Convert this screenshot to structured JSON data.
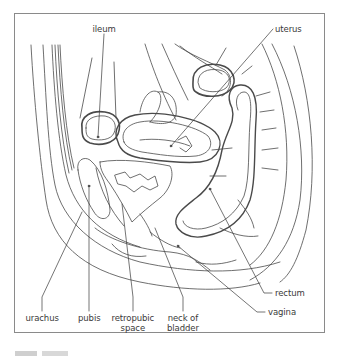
{
  "figure": {
    "labels": [
      {
        "id": "ileum",
        "text": "ileum",
        "anchor": [
          104,
          46
        ],
        "target": [
          98,
          137
        ]
      },
      {
        "id": "uterus",
        "text": "uterus",
        "anchor": [
          275,
          29
        ],
        "target": [
          171,
          146
        ]
      },
      {
        "id": "urachus",
        "text": "urachus",
        "anchor": [
          42,
          313
        ],
        "target": [
          82,
          212
        ]
      },
      {
        "id": "pubis",
        "text": "pubis",
        "anchor": [
          89,
          313
        ],
        "target": [
          89,
          186
        ]
      },
      {
        "id": "retropubic-space",
        "text": "retropubic\nspace",
        "anchor": [
          133,
          313
        ],
        "target": [
          122,
          204
        ]
      },
      {
        "id": "neck-of-bladder",
        "text": "neck of\nbladder",
        "anchor": [
          183,
          313
        ],
        "target": [
          155,
          228
        ]
      },
      {
        "id": "rectum",
        "text": "rectum",
        "anchor": [
          272,
          293
        ],
        "target": [
          210,
          189
        ]
      },
      {
        "id": "vagina",
        "text": "vagina",
        "anchor": [
          265,
          312
        ],
        "target": [
          178,
          246
        ]
      }
    ]
  },
  "colors": {
    "line": "#4a4a4a",
    "leader": "#3a3a3a",
    "frame": "#8a8a8a",
    "text": "#3a3a3a"
  }
}
